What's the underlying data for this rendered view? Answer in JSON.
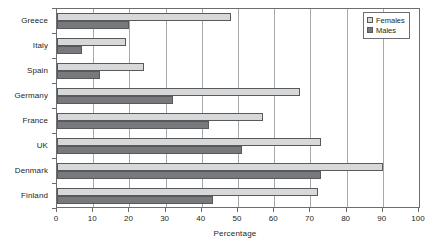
{
  "chart_data": {
    "type": "bar",
    "orientation": "horizontal",
    "title": "",
    "xlabel": "Percentage",
    "ylabel": "",
    "xlim": [
      0,
      100
    ],
    "xticks": [
      0,
      10,
      20,
      30,
      40,
      50,
      60,
      70,
      80,
      90,
      100
    ],
    "grid": true,
    "legend_position": "top-right",
    "categories": [
      "Greece",
      "Italy",
      "Spain",
      "Germany",
      "France",
      "UK",
      "Denmark",
      "Finland"
    ],
    "series": [
      {
        "name": "Females",
        "color": "#d7d8da",
        "values": [
          48,
          19,
          24,
          67,
          57,
          73,
          90,
          72
        ]
      },
      {
        "name": "Males",
        "color": "#77797c",
        "values": [
          20,
          7,
          12,
          32,
          42,
          51,
          73,
          43
        ]
      }
    ]
  },
  "legend": {
    "items": [
      {
        "label": "Females",
        "swatch": "females-swatch"
      },
      {
        "label": "Males",
        "swatch": "males-swatch"
      }
    ]
  }
}
